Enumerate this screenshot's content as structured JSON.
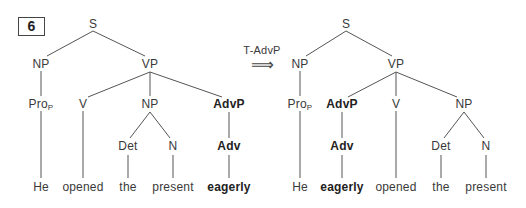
{
  "example_number": "6",
  "transformation": {
    "label": "T-AdvP",
    "arrow": "⟹"
  },
  "left_tree": {
    "S": "S",
    "NP": "NP",
    "VP": "VP",
    "Pro": "Pro",
    "Pro_sub": "P",
    "V": "V",
    "NP2": "NP",
    "AdvP": "AdvP",
    "Det": "Det",
    "N": "N",
    "Adv": "Adv",
    "words": [
      "He",
      "opened",
      "the",
      "present",
      "eagerly"
    ]
  },
  "right_tree": {
    "S": "S",
    "NP": "NP",
    "VP": "VP",
    "Pro": "Pro",
    "Pro_sub": "P",
    "AdvP": "AdvP",
    "V": "V",
    "NP2": "NP",
    "Adv": "Adv",
    "Det": "Det",
    "N": "N",
    "words": [
      "He",
      "eagerly",
      "opened",
      "the",
      "present"
    ]
  }
}
